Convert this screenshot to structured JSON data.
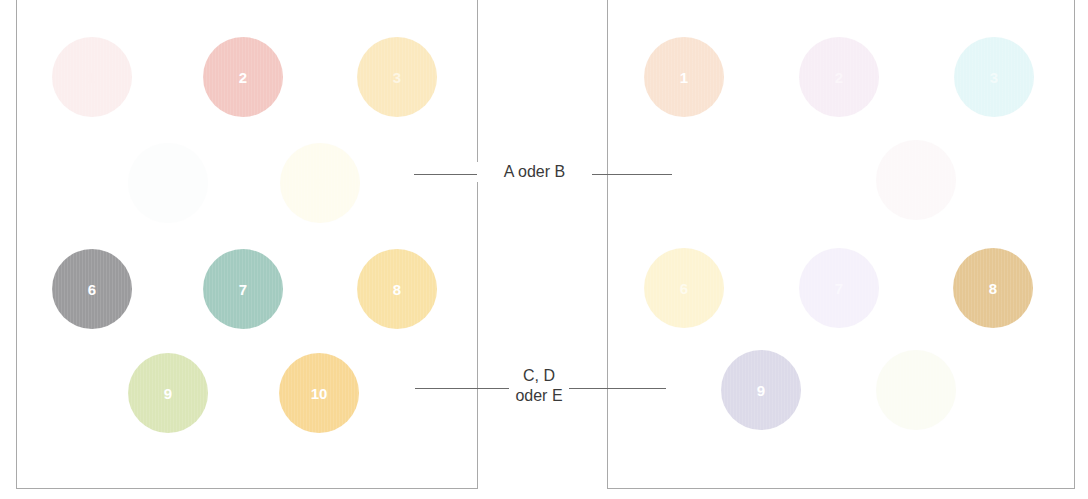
{
  "labels": {
    "top": "A oder B",
    "bottom_line1": "C, D",
    "bottom_line2": "oder E"
  },
  "left_panel": {
    "dots": [
      {
        "n": "1",
        "x": 92,
        "y": 77,
        "color": "#fbeeee",
        "text_color": "#fbeeee"
      },
      {
        "n": "2",
        "x": 243,
        "y": 77,
        "color": "#f3c8c3",
        "text_color": "#ffffff"
      },
      {
        "n": "3",
        "x": 397,
        "y": 77,
        "color": "#fbe9bf",
        "text_color": "#fdf6e4"
      },
      {
        "n": "4",
        "x": 168,
        "y": 183,
        "color": "#fcfdfd",
        "text_color": "#fcfdfd"
      },
      {
        "n": "5",
        "x": 320,
        "y": 183,
        "color": "#fefcef",
        "text_color": "#fefcef"
      },
      {
        "n": "6",
        "x": 92,
        "y": 289,
        "color": "#9b9b9d",
        "text_color": "#ffffff"
      },
      {
        "n": "7",
        "x": 243,
        "y": 289,
        "color": "#a3cbc0",
        "text_color": "#ffffff"
      },
      {
        "n": "8",
        "x": 397,
        "y": 289,
        "color": "#f9e2a6",
        "text_color": "#ffffff"
      },
      {
        "n": "9",
        "x": 168,
        "y": 393,
        "color": "#dbe6b8",
        "text_color": "#ffffff"
      },
      {
        "n": "10",
        "x": 319,
        "y": 393,
        "color": "#f8d895",
        "text_color": "#ffffff"
      }
    ]
  },
  "right_panel": {
    "dots": [
      {
        "n": "1",
        "x": 684,
        "y": 77,
        "color": "#f9e3d2",
        "text_color": "#ffffff"
      },
      {
        "n": "2",
        "x": 839,
        "y": 77,
        "color": "#f7eef6",
        "text_color": "#fbf6fa"
      },
      {
        "n": "3",
        "x": 994,
        "y": 77,
        "color": "#e4f7f8",
        "text_color": "#f3fbfb"
      },
      {
        "n": "4",
        "x": 916,
        "y": 180,
        "color": "#fcf8f9",
        "text_color": "#fcf8f9"
      },
      {
        "n": "6",
        "x": 684,
        "y": 288,
        "color": "#fdf4d3",
        "text_color": "#fefbee"
      },
      {
        "n": "7",
        "x": 839,
        "y": 288,
        "color": "#f5f1fb",
        "text_color": "#faf8fd"
      },
      {
        "n": "8",
        "x": 993,
        "y": 288,
        "color": "#e5c794",
        "text_color": "#ffffff"
      },
      {
        "n": "9",
        "x": 761,
        "y": 390,
        "color": "#dcdae9",
        "text_color": "#ffffff"
      },
      {
        "n": "10",
        "x": 916,
        "y": 390,
        "color": "#fbfcf4",
        "text_color": "#fbfcf4"
      }
    ]
  },
  "connectors": [
    {
      "x1": 414,
      "x2": 477,
      "y": 174
    },
    {
      "x1": 592,
      "x2": 672,
      "y": 174
    },
    {
      "x1": 415,
      "x2": 509,
      "y": 388
    },
    {
      "x1": 569,
      "x2": 666,
      "y": 388
    }
  ]
}
